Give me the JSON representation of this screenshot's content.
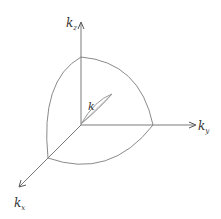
{
  "diagram": {
    "type": "3d-axes-sphere-octant",
    "colors": {
      "axis": "#7a7a7a",
      "curve": "#8a8a8a",
      "text": "#333333",
      "background": "#ffffff"
    },
    "axes": {
      "z": {
        "label_main": "k",
        "label_sub": "z"
      },
      "y": {
        "label_main": "k",
        "label_sub": "y"
      },
      "x": {
        "label_main": "k",
        "label_sub": "x"
      }
    },
    "vector": {
      "label": "k"
    }
  }
}
